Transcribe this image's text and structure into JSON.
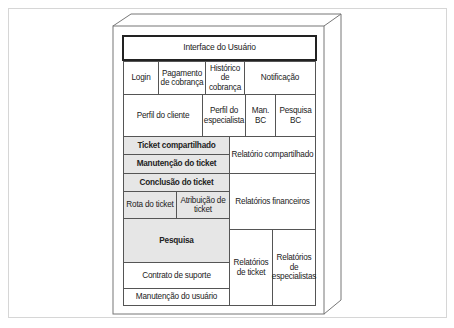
{
  "diagram": {
    "title": "Interface do Usuário",
    "row1": [
      "Login",
      "Pagamento de cobrança",
      "Histórico de cobrança",
      "Notificação"
    ],
    "row2": [
      "Perfil do cliente",
      "Perfil do especialista",
      "Man. BC",
      "Pesquisa BC"
    ],
    "left": {
      "ticket_compartilhado": "Ticket compartilhado",
      "manutencao_ticket": "Manutenção do ticket",
      "conclusao_ticket": "Conclusão do ticket",
      "rota_ticket": "Rota do ticket",
      "atribuicao_ticket": "Atribuição de ticket",
      "pesquisa": "Pesquisa",
      "contrato_suporte": "Contrato de suporte",
      "manutencao_usuario": "Manutenção do usuário"
    },
    "right": {
      "relatorio_compartilhado": "Relatório compartilhado",
      "relatorios_financeiros": "Relatórios financeiros",
      "relatorios_ticket": "Relatórios de ticket",
      "relatorios_especialistas": "Relatórios de especialistas"
    },
    "colors": {
      "shade": "#e6e6e6",
      "border": "#555555",
      "title_border": "#222222"
    }
  }
}
